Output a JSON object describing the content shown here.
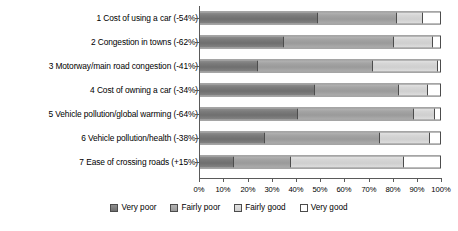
{
  "chart_data": {
    "type": "bar",
    "orientation": "horizontal",
    "stacked": true,
    "stack_mode": "percent",
    "title": "",
    "xlabel": "",
    "ylabel": "",
    "xlim": [
      0,
      100
    ],
    "grid": false,
    "legend_position": "bottom",
    "categories": [
      "1 Cost of using a car (-54%)",
      "2 Congestion in towns (-62%)",
      "3 Motorway/main road congestion (-41%)",
      "4 Cost of owning a car (-34%)",
      "5 Vehicle pollution/global warming (-64%)",
      "6 Vehicle pollution/health (-38%)",
      "7 Ease of crossing roads (+15%)"
    ],
    "series": [
      {
        "name": "Very poor",
        "color": "#7b7b7b",
        "values": [
          49,
          35,
          24,
          48,
          41,
          27,
          14
        ]
      },
      {
        "name": "Fairly poor",
        "color": "#a3a3a3",
        "values": [
          33,
          46,
          48,
          35,
          48,
          48,
          24
        ]
      },
      {
        "name": "Fairly good",
        "color": "#d6d6d6",
        "values": [
          11,
          16,
          27,
          12,
          9,
          21,
          47
        ]
      },
      {
        "name": "Very good",
        "color": "#ffffff",
        "values": [
          7,
          3,
          1,
          5,
          2,
          4,
          15
        ]
      }
    ],
    "xticks": [
      0,
      10,
      20,
      30,
      40,
      50,
      60,
      70,
      80,
      90,
      100
    ],
    "xticklabels": [
      "0%",
      "10%",
      "20%",
      "30%",
      "40%",
      "50%",
      "60%",
      "70%",
      "80%",
      "90%",
      "100%"
    ]
  },
  "legend": {
    "items": [
      {
        "label": "Very poor"
      },
      {
        "label": "Fairly poor"
      },
      {
        "label": "Fairly good"
      },
      {
        "label": "Very good"
      }
    ]
  }
}
